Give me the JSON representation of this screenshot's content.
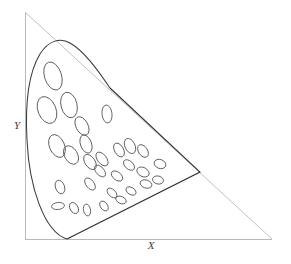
{
  "figure": {
    "title": "",
    "background_color": "#ffffff",
    "width": 291,
    "height": 264,
    "axis_color": "#b9b9b9",
    "curve_color": "#3a3a3a",
    "ellipse_color": "#555555"
  },
  "axes": {
    "x_label": "X",
    "y_label": "Y",
    "x_label_position": {
      "x": 151,
      "y": 249
    },
    "y_label_position": {
      "x": 17,
      "y": 129
    },
    "origin": {
      "x": 25,
      "y": 239
    },
    "x_axis_end": {
      "x": 272,
      "y": 239
    },
    "y_axis_end": {
      "x": 25,
      "y": 12
    }
  },
  "chart_data": {
    "type": "scatter",
    "title": "",
    "xlabel": "X",
    "ylabel": "Y",
    "xlim": [
      0,
      1
    ],
    "ylim": [
      0,
      1
    ],
    "grid": false,
    "legend": "none",
    "triangle": {
      "vertices": [
        [
          25,
          239
        ],
        [
          272,
          239
        ],
        [
          25,
          12
        ]
      ],
      "closed": true
    },
    "spectral_locus_path": "M 67 239 C 44 232 29 186 27 140 C 25 104 29 72 40 54 C 48 41 60 37 70 43 C 84 51 97 69 110 88",
    "gamut_boundary": {
      "points": [
        [
          67,
          239
        ],
        [
          200,
          172
        ],
        [
          110,
          88
        ]
      ],
      "note": "straight chords closing the locus region: purple line from locus foot to right vertex and the upper chord back to the locus"
    },
    "ellipses": [
      {
        "cx": 53,
        "cy": 76,
        "rx": 8.5,
        "ry": 14.5,
        "angle": -18
      },
      {
        "cx": 47,
        "cy": 110,
        "rx": 9.0,
        "ry": 14.0,
        "angle": -22
      },
      {
        "cx": 69,
        "cy": 105,
        "rx": 8.0,
        "ry": 13.0,
        "angle": -14
      },
      {
        "cx": 82,
        "cy": 126,
        "rx": 6.0,
        "ry": 10.0,
        "angle": -28
      },
      {
        "cx": 107,
        "cy": 114,
        "rx": 5.0,
        "ry": 9.0,
        "angle": -6
      },
      {
        "cx": 57,
        "cy": 146,
        "rx": 7.5,
        "ry": 12.0,
        "angle": -24
      },
      {
        "cx": 71,
        "cy": 155,
        "rx": 6.5,
        "ry": 10.0,
        "angle": -30
      },
      {
        "cx": 86,
        "cy": 144,
        "rx": 5.5,
        "ry": 9.5,
        "angle": -20
      },
      {
        "cx": 90,
        "cy": 162,
        "rx": 5.0,
        "ry": 8.5,
        "angle": -34
      },
      {
        "cx": 102,
        "cy": 159,
        "rx": 4.5,
        "ry": 8.0,
        "angle": -38
      },
      {
        "cx": 100,
        "cy": 171,
        "rx": 4.0,
        "ry": 7.0,
        "angle": -42
      },
      {
        "cx": 119,
        "cy": 150,
        "rx": 4.5,
        "ry": 7.5,
        "angle": -30
      },
      {
        "cx": 130,
        "cy": 146,
        "rx": 5.0,
        "ry": 8.0,
        "angle": -26
      },
      {
        "cx": 143,
        "cy": 151,
        "rx": 4.5,
        "ry": 7.0,
        "angle": -34
      },
      {
        "cx": 129,
        "cy": 165,
        "rx": 4.0,
        "ry": 6.5,
        "angle": -48
      },
      {
        "cx": 117,
        "cy": 176,
        "rx": 4.0,
        "ry": 6.5,
        "angle": -52
      },
      {
        "cx": 143,
        "cy": 172,
        "rx": 4.5,
        "ry": 6.5,
        "angle": -62
      },
      {
        "cx": 160,
        "cy": 164,
        "rx": 4.5,
        "ry": 6.0,
        "angle": -70
      },
      {
        "cx": 146,
        "cy": 184,
        "rx": 4.0,
        "ry": 6.0,
        "angle": -72
      },
      {
        "cx": 131,
        "cy": 191,
        "rx": 3.5,
        "ry": 5.5,
        "angle": -58
      },
      {
        "cx": 112,
        "cy": 193,
        "rx": 3.5,
        "ry": 6.0,
        "angle": -46
      },
      {
        "cx": 90,
        "cy": 184,
        "rx": 4.0,
        "ry": 7.0,
        "angle": -38
      },
      {
        "cx": 60,
        "cy": 187,
        "rx": 4.5,
        "ry": 7.0,
        "angle": -20
      },
      {
        "cx": 58,
        "cy": 206,
        "rx": 6.5,
        "ry": 3.5,
        "angle": -6
      },
      {
        "cx": 74,
        "cy": 208,
        "rx": 4.0,
        "ry": 6.0,
        "angle": -30
      },
      {
        "cx": 87,
        "cy": 210,
        "rx": 3.5,
        "ry": 6.0,
        "angle": -12
      },
      {
        "cx": 104,
        "cy": 206,
        "rx": 3.5,
        "ry": 5.5,
        "angle": -36
      },
      {
        "cx": 121,
        "cy": 200,
        "rx": 3.5,
        "ry": 5.5,
        "angle": -66
      },
      {
        "cx": 158,
        "cy": 180,
        "rx": 4.0,
        "ry": 5.5,
        "angle": -76
      }
    ]
  }
}
